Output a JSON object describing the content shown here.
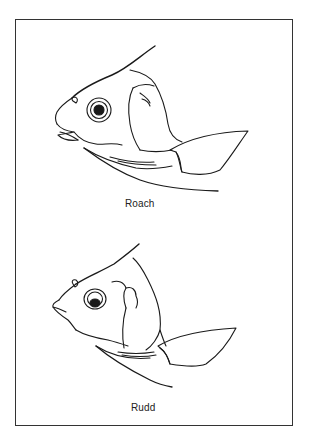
{
  "figure": {
    "panels": [
      {
        "name": "roach",
        "label": "Roach"
      },
      {
        "name": "rudd",
        "label": "Rudd"
      }
    ],
    "colors": {
      "line": "#1a1a1a",
      "border": "#333333",
      "background": "#ffffff"
    }
  }
}
